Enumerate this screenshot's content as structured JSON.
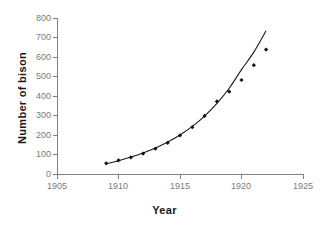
{
  "chart_data": {
    "type": "scatter",
    "title": "",
    "xlabel": "Year",
    "ylabel": "Number of bison",
    "xlim": [
      1905,
      1925
    ],
    "ylim": [
      0,
      800
    ],
    "xticks": [
      1905,
      1910,
      1915,
      1920,
      1925
    ],
    "yticks": [
      0,
      100,
      200,
      300,
      400,
      500,
      600,
      700,
      800
    ],
    "grid": false,
    "legend": null,
    "x": [
      1909,
      1910,
      1911,
      1912,
      1913,
      1914,
      1915,
      1916,
      1917,
      1918,
      1919,
      1920,
      1921,
      1922
    ],
    "values": [
      55,
      70,
      85,
      105,
      130,
      160,
      198,
      240,
      298,
      372,
      422,
      482,
      558,
      638
    ],
    "series": [
      {
        "name": "Number of bison",
        "marker": "diamond",
        "color": "#111111",
        "x": [
          1909,
          1910,
          1911,
          1912,
          1913,
          1914,
          1915,
          1916,
          1917,
          1918,
          1919,
          1920,
          1921,
          1922
        ],
        "values": [
          55,
          70,
          85,
          105,
          130,
          160,
          198,
          240,
          298,
          372,
          422,
          482,
          558,
          638
        ]
      },
      {
        "name": "exponential trend line",
        "type": "line",
        "color": "#1a1a1a",
        "x": [
          1909,
          1910,
          1911,
          1912,
          1913,
          1914,
          1915,
          1916,
          1917,
          1918,
          1919,
          1920,
          1921,
          1922
        ],
        "values": [
          52,
          68,
          87,
          108,
          133,
          164,
          200,
          244,
          297,
          362,
          440,
          535,
          625,
          735
        ]
      }
    ],
    "annotations": []
  },
  "axes": {
    "x_title": "Year",
    "y_title": "Number of bison",
    "x_tick_labels": [
      "1905",
      "1910",
      "1915",
      "1920",
      "1925"
    ],
    "y_tick_labels": [
      "0",
      "100",
      "200",
      "300",
      "400",
      "500",
      "600",
      "700",
      "800"
    ]
  },
  "colors": {
    "axis": "#808080",
    "tick_label": "#7b7b7b",
    "title": "#1a1a1a",
    "marker": "#111111",
    "curve": "#1a1a1a",
    "background": "#ffffff"
  }
}
